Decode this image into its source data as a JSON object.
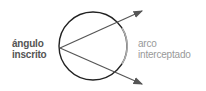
{
  "diagram": {
    "left_label": [
      "ángulo",
      "inscrito"
    ],
    "right_label": [
      "arco",
      "interceptado"
    ],
    "colors": {
      "circle": "#222222",
      "arc": "#999999",
      "arrows": "#555555",
      "left_text": "#555555",
      "right_text": "#999999"
    }
  }
}
